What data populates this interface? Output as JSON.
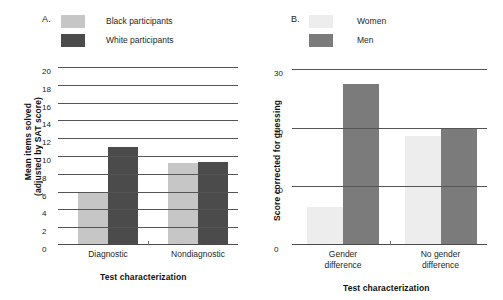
{
  "figure": {
    "panels": [
      {
        "letter": "A.",
        "legend": [
          {
            "label": "Black participants",
            "color": "#c6c6c6"
          },
          {
            "label": "White participants",
            "color": "#4b4b4b"
          }
        ],
        "ylabel_line1": "Mean items solved",
        "ylabel_line2": "(adjusted by SAT score)",
        "xlabel": "Test characterization"
      },
      {
        "letter": "B.",
        "legend": [
          {
            "label": "Women",
            "color": "#ededed"
          },
          {
            "label": "Men",
            "color": "#7b7b7b"
          }
        ],
        "ylabel_line1": "Score corrected for guessing",
        "xlabel": "Test characterization"
      }
    ]
  },
  "chart_data": [
    {
      "type": "bar",
      "title": "",
      "panel": "A",
      "categories": [
        "Diagnostic",
        "Nondiagnostic"
      ],
      "series": [
        {
          "name": "Black participants",
          "color": "#c6c6c6",
          "values": [
            5.8,
            9.2
          ]
        },
        {
          "name": "White participants",
          "color": "#4b4b4b",
          "values": [
            11.0,
            9.3
          ]
        }
      ],
      "xlabel": "Test characterization",
      "ylabel": "Mean items solved (adjusted by SAT score)",
      "ylim": [
        0,
        20
      ],
      "yticks": [
        0,
        2,
        4,
        6,
        8,
        10,
        12,
        14,
        16,
        18,
        20
      ],
      "ytick_labels": [
        "0",
        "2",
        "4",
        "6",
        "8",
        "10",
        "12",
        "14",
        "16",
        "18",
        "20"
      ],
      "grid": true,
      "legend_position": "top-left"
    },
    {
      "type": "bar",
      "title": "",
      "panel": "B",
      "categories": [
        "Gender difference",
        "No gender difference"
      ],
      "series": [
        {
          "name": "Women",
          "color": "#ededed",
          "values": [
            6.5,
            18.5
          ]
        },
        {
          "name": "Men",
          "color": "#7b7b7b",
          "values": [
            27.5,
            20.0
          ]
        }
      ],
      "xlabel": "Test characterization",
      "ylabel": "Score corrected for guessing",
      "ylim": [
        0,
        30
      ],
      "yticks": [
        0,
        10,
        20,
        30
      ],
      "ytick_labels": [
        "0",
        "10",
        "20",
        "30"
      ],
      "grid": true,
      "legend_position": "top-left"
    }
  ]
}
